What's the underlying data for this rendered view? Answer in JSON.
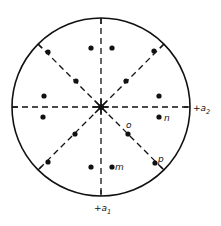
{
  "figure": {
    "type": "stereographic-projection",
    "primitive_circle": {
      "cx": 101,
      "cy": 107,
      "r": 89
    },
    "center_pole": {
      "x": 101,
      "y": 107
    },
    "mirror_lines": [
      {
        "name": "vertical",
        "x1": 101,
        "y1": 18,
        "x2": 101,
        "y2": 196
      },
      {
        "name": "horizontal",
        "x1": 12,
        "y1": 107,
        "x2": 190,
        "y2": 107
      },
      {
        "name": "diagonal-nw-se",
        "x1": 38,
        "y1": 44,
        "x2": 164,
        "y2": 170
      },
      {
        "name": "diagonal-ne-sw",
        "x1": 164,
        "y1": 44,
        "x2": 38,
        "y2": 170
      }
    ],
    "poles": [
      {
        "x": 91,
        "y": 48
      },
      {
        "x": 112,
        "y": 48
      },
      {
        "x": 48,
        "y": 52
      },
      {
        "x": 154,
        "y": 51
      },
      {
        "x": 76,
        "y": 81
      },
      {
        "x": 126,
        "y": 81
      },
      {
        "x": 44,
        "y": 96
      },
      {
        "x": 159,
        "y": 96
      },
      {
        "x": 43,
        "y": 117
      },
      {
        "x": 159,
        "y": 117,
        "label": "n"
      },
      {
        "x": 75,
        "y": 134
      },
      {
        "x": 128,
        "y": 134,
        "label": "o"
      },
      {
        "x": 48,
        "y": 162
      },
      {
        "x": 155,
        "y": 163,
        "label": "p"
      },
      {
        "x": 91,
        "y": 167
      },
      {
        "x": 112,
        "y": 167,
        "label": "m"
      }
    ],
    "point_labels": {
      "o": "o",
      "n": "n",
      "p": "p",
      "m": "m"
    },
    "axes": {
      "a1": {
        "prefix": "+a",
        "subscript": "1"
      },
      "a2": {
        "prefix": "+a",
        "subscript": "2"
      }
    },
    "colors": {
      "ink": "#111111",
      "background": "#ffffff"
    }
  }
}
